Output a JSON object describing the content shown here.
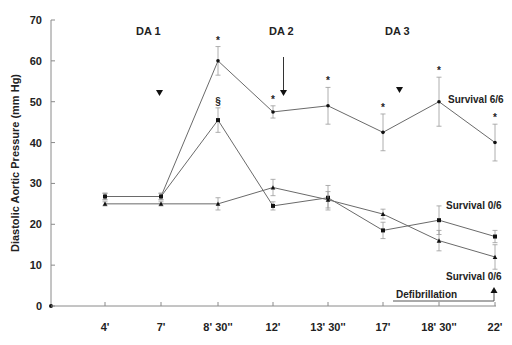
{
  "chart_data": {
    "type": "line",
    "title": "",
    "xlabel": "",
    "ylabel": "Diastolic Aortic Pressure (mm Hg)",
    "ylim": [
      0,
      70
    ],
    "yticks": [
      0,
      10,
      20,
      30,
      40,
      50,
      60,
      70
    ],
    "grid": false,
    "categories": [
      "4'",
      "7'",
      "8' 30''",
      "12'",
      "13' 30''",
      "17'",
      "18' 30''",
      "22'"
    ],
    "series": [
      {
        "name": "Survival 6/6",
        "marker": "circle",
        "values": [
          26.8,
          26.8,
          60,
          47.5,
          49,
          42.5,
          50,
          40
        ],
        "errors": [
          0.8,
          0.8,
          3.5,
          1.5,
          4.5,
          4.5,
          6,
          4.5
        ],
        "significance": [
          "",
          "",
          "*",
          "*",
          "*",
          "*",
          "*",
          "*"
        ]
      },
      {
        "name": "Survival 0/6 (upper)",
        "marker": "square",
        "values": [
          26.8,
          26.8,
          45.5,
          24.5,
          26.5,
          18.5,
          21,
          17
        ],
        "errors": [
          0.8,
          0.8,
          3,
          1,
          3,
          2,
          3.5,
          1.5
        ],
        "significance": [
          "",
          "",
          "§",
          "",
          "",
          "",
          "",
          ""
        ]
      },
      {
        "name": "Survival 0/6 (lower)",
        "marker": "triangle",
        "values": [
          25,
          25,
          25,
          29,
          26,
          22.5,
          16,
          12
        ],
        "errors": [
          0.5,
          0.5,
          1.5,
          2,
          2,
          1.2,
          2.5,
          3
        ],
        "significance": [
          "",
          "",
          "",
          "",
          "",
          "",
          "",
          ""
        ]
      }
    ],
    "annotations": [
      {
        "text": "DA 1",
        "x_between": [
          "4'",
          "8' 30''"
        ]
      },
      {
        "text": "DA 2",
        "x_between": [
          "12'",
          "13' 30''"
        ]
      },
      {
        "text": "DA 3",
        "x_between": [
          "13' 30''",
          "18' 30''"
        ]
      },
      {
        "text": "Survival 6/6",
        "series": 0
      },
      {
        "text": "Survival 0/6",
        "series": 1
      },
      {
        "text": "Survival 0/6",
        "series": 2
      },
      {
        "text": "Defibrillation",
        "at": "22'"
      }
    ],
    "legend": "none (inline labels)"
  },
  "labels": {
    "da1": "DA 1",
    "da2": "DA 2",
    "da3": "DA 3",
    "survival_top": "Survival 6/6",
    "survival_mid": "Survival 0/6",
    "survival_bottom": "Survival 0/6",
    "defibrillation": "Defibrillation",
    "star": "*",
    "section": "§"
  }
}
